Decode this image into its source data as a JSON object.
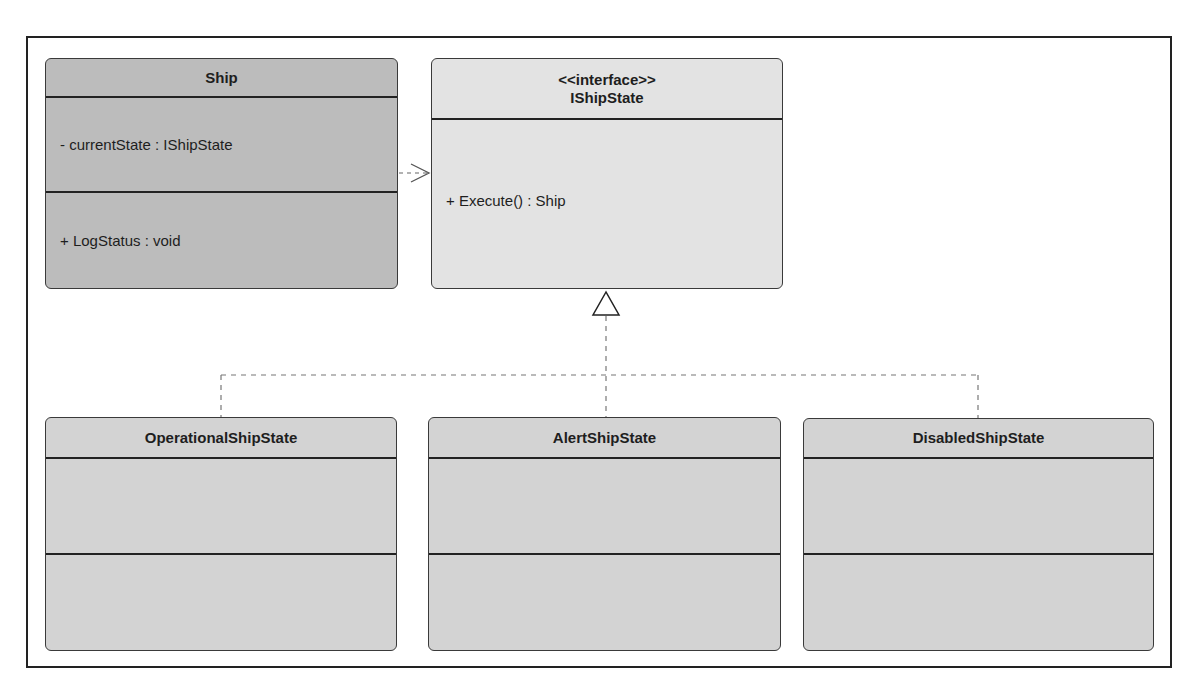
{
  "diagram": {
    "type": "UML class diagram",
    "pattern": "State"
  },
  "classes": {
    "ship": {
      "name": "Ship",
      "attributes": [
        "- currentState : IShipState"
      ],
      "methods": [
        "+ LogStatus : void"
      ]
    },
    "ishipstate": {
      "stereotype": "<<interface>>",
      "name": "IShipState",
      "methods": [
        "+ Execute() : Ship"
      ]
    },
    "operational": {
      "name": "OperationalShipState",
      "attributes": [],
      "methods": []
    },
    "alert": {
      "name": "AlertShipState",
      "attributes": [],
      "methods": []
    },
    "disabled": {
      "name": "DisabledShipState",
      "attributes": [],
      "methods": []
    }
  },
  "relationships": [
    {
      "type": "dependency",
      "from": "Ship",
      "to": "IShipState"
    },
    {
      "type": "realization",
      "from": "OperationalShipState",
      "to": "IShipState"
    },
    {
      "type": "realization",
      "from": "AlertShipState",
      "to": "IShipState"
    },
    {
      "type": "realization",
      "from": "DisabledShipState",
      "to": "IShipState"
    }
  ],
  "colors": {
    "ship_fill": "#bcbcbc",
    "interface_fill": "#e3e3e3",
    "state_fill": "#d3d3d3",
    "stroke": "#222222"
  }
}
